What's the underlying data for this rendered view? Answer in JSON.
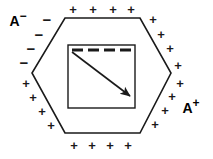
{
  "figure": {
    "colors": {
      "stroke": "#1a1a1a",
      "background": "#ffffff",
      "charge": "#1a1a1a"
    },
    "hexagon": {
      "name": "cell-outline-hexagon",
      "points": "65,18 140,18 171,73 140,133 65,133 32,73",
      "stroke_width": 1.6
    },
    "inner_rectangle": {
      "name": "inner-compartment-rectangle",
      "x": 68,
      "y": 45,
      "width": 67,
      "height": 63,
      "stroke_width": 1.4
    },
    "dashed_line": {
      "name": "dashed-membrane-line",
      "x1": 72,
      "y1": 50,
      "x2": 132,
      "y2": 50,
      "stroke_width": 3,
      "dash_pattern": "11 5"
    },
    "arrow": {
      "name": "field-direction-arrow",
      "x1": 72,
      "y1": 52,
      "x2": 130,
      "y2": 96,
      "stroke_width": 1.6
    },
    "labels": [
      {
        "name": "terminal-label-negative",
        "base": "A",
        "sign": "−",
        "x": 18,
        "y": 21
      },
      {
        "name": "terminal-label-positive",
        "base": "A",
        "sign": "+",
        "x": 191,
        "y": 108
      }
    ],
    "charges": {
      "minus_symbol": "−",
      "plus_symbol": "+",
      "minus_signs": [
        {
          "x": 47,
          "y": 19
        },
        {
          "x": 39,
          "y": 34
        },
        {
          "x": 31,
          "y": 48
        },
        {
          "x": 24,
          "y": 62
        }
      ],
      "plus_signs_top": [
        {
          "x": 73,
          "y": 9
        },
        {
          "x": 93,
          "y": 9
        },
        {
          "x": 113,
          "y": 9
        },
        {
          "x": 131,
          "y": 9
        }
      ],
      "plus_signs_upper_right": [
        {
          "x": 153,
          "y": 19
        },
        {
          "x": 161,
          "y": 34
        },
        {
          "x": 170,
          "y": 48
        },
        {
          "x": 178,
          "y": 65
        }
      ],
      "plus_signs_lower_right": [
        {
          "x": 180,
          "y": 83
        },
        {
          "x": 172,
          "y": 96
        },
        {
          "x": 165,
          "y": 110
        },
        {
          "x": 155,
          "y": 124
        }
      ],
      "plus_signs_bottom": [
        {
          "x": 74,
          "y": 145
        },
        {
          "x": 92,
          "y": 145
        },
        {
          "x": 110,
          "y": 145
        },
        {
          "x": 128,
          "y": 145
        }
      ],
      "plus_signs_lower_left": [
        {
          "x": 26,
          "y": 83
        },
        {
          "x": 33,
          "y": 97
        },
        {
          "x": 42,
          "y": 111
        },
        {
          "x": 51,
          "y": 125
        }
      ]
    }
  }
}
